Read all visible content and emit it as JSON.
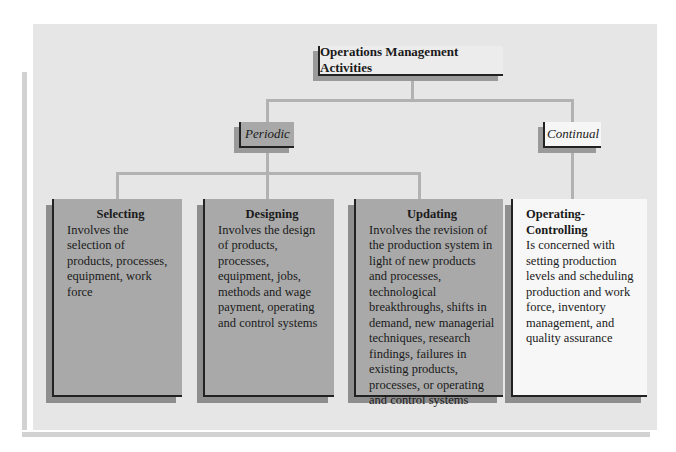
{
  "diagram": {
    "title": "Operations Management Activities",
    "categories": [
      {
        "label": "Periodic"
      },
      {
        "label": "Continual"
      }
    ],
    "activities": [
      {
        "category": "Periodic",
        "title": "Selecting",
        "description": "Involves the selection of products, processes, equipment, work force"
      },
      {
        "category": "Periodic",
        "title": "Designing",
        "description": "Involves the design of products, processes, equipment, jobs, methods and wage payment, operating and control systems"
      },
      {
        "category": "Periodic",
        "title": "Updating",
        "description": "Involves the revision of the production system in light of new products and processes, technological breakthroughs, shifts in demand, new managerial techniques, research findings, failures in existing products, processes, or operating and control systems"
      },
      {
        "category": "Continual",
        "title": "Operating-Controlling",
        "description": "Is concerned with setting production levels and scheduling production and work force, inventory management, and quality assurance"
      }
    ]
  },
  "colors": {
    "panel_background": "#e6e6e6",
    "periodic_fill": "#a9a9a9",
    "continual_fill": "#f7f7f7",
    "connector": "#b2b2b2",
    "shadow": "#8e8e8e"
  }
}
